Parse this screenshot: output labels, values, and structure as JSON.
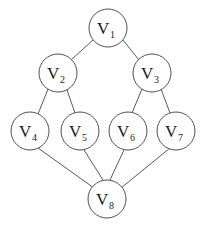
{
  "diagram": {
    "type": "node-link-graph",
    "background_color": "#ffffff",
    "node_fill_color": "#ffffff",
    "node_stroke_color": "#4f4f4f",
    "edge_color": "#5a5a5a",
    "label_color": "#1a1a1a",
    "node_radius": 19,
    "nodes": [
      {
        "id": "v1",
        "base": "V",
        "subscript": "1",
        "label": "V1",
        "cx": 108,
        "cy": 28
      },
      {
        "id": "v2",
        "base": "V",
        "subscript": "2",
        "label": "V2",
        "cx": 58,
        "cy": 73
      },
      {
        "id": "v3",
        "base": "V",
        "subscript": "3",
        "label": "V3",
        "cx": 152,
        "cy": 73
      },
      {
        "id": "v4",
        "base": "V",
        "subscript": "4",
        "label": "V4",
        "cx": 30,
        "cy": 131
      },
      {
        "id": "v5",
        "base": "V",
        "subscript": "5",
        "label": "V5",
        "cx": 80,
        "cy": 131
      },
      {
        "id": "v6",
        "base": "V",
        "subscript": "6",
        "label": "V6",
        "cx": 128,
        "cy": 131
      },
      {
        "id": "v7",
        "base": "V",
        "subscript": "7",
        "label": "V7",
        "cx": 176,
        "cy": 131
      },
      {
        "id": "v8",
        "base": "V",
        "subscript": "8",
        "label": "V8",
        "cx": 107,
        "cy": 199
      }
    ],
    "edges": [
      {
        "id": "e1",
        "from": "v1",
        "to": "v2",
        "x1": 93,
        "y1": 40,
        "x2": 71,
        "y2": 60
      },
      {
        "id": "e2",
        "from": "v1",
        "to": "v3",
        "x1": 123,
        "y1": 40,
        "x2": 139,
        "y2": 60
      },
      {
        "id": "e3",
        "from": "v2",
        "to": "v4",
        "x1": 48,
        "y1": 89,
        "x2": 38,
        "y2": 114
      },
      {
        "id": "e4",
        "from": "v2",
        "to": "v5",
        "x1": 67,
        "y1": 90,
        "x2": 75,
        "y2": 113
      },
      {
        "id": "e5",
        "from": "v3",
        "to": "v6",
        "x1": 142,
        "y1": 89,
        "x2": 132,
        "y2": 113
      },
      {
        "id": "e6",
        "from": "v3",
        "to": "v7",
        "x1": 161,
        "y1": 89,
        "x2": 170,
        "y2": 113
      },
      {
        "id": "e7",
        "from": "v4",
        "to": "v8",
        "x1": 38,
        "y1": 148,
        "x2": 94,
        "y2": 188
      },
      {
        "id": "e8",
        "from": "v5",
        "to": "v8",
        "x1": 84,
        "y1": 150,
        "x2": 103,
        "y2": 180
      },
      {
        "id": "e9",
        "from": "v6",
        "to": "v8",
        "x1": 124,
        "y1": 150,
        "x2": 110,
        "y2": 180
      },
      {
        "id": "e10",
        "from": "v7",
        "to": "v8",
        "x1": 170,
        "y1": 148,
        "x2": 121,
        "y2": 188
      }
    ]
  }
}
